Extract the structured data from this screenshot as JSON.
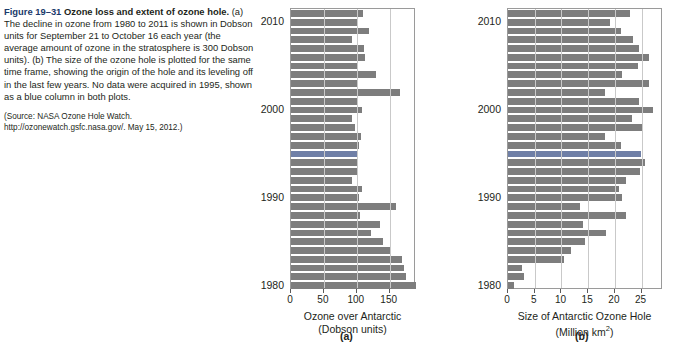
{
  "caption": {
    "figure_number": "Figure 19–31",
    "title": "Ozone loss and extent of ozone hole.",
    "body": "(a) The decline in ozone from 1980 to 2011 is shown in Dobson units for September 21 to October 16 each year (the average amount of ozone in the stratosphere is 300 Dobson units). (b) The size of the ozone hole is plotted for the same time frame, showing the origin of the hole and its leveling off in the last few years. No data were acquired in 1995, shown as a blue column in both plots.",
    "source": "(Source: NASA Ozone Hole Watch. http://ozonewatch.gsfc.nasa.gov/. May 15, 2012.)"
  },
  "panels": {
    "a_label": "(a)",
    "b_label": "(b)"
  },
  "colors": {
    "bar": "#7d7d7d",
    "missing_bar": "#6f7fa6",
    "grid": "#c9c9c9",
    "frame": "#9a9a9a",
    "fignum": "#1b3a6b"
  },
  "chart_data": [
    {
      "id": "a",
      "type": "bar",
      "orientation": "horizontal",
      "title": "",
      "xlabel": "Ozone over Antarctic",
      "xlabel_units": "(Dobson units)",
      "ylabel": "",
      "xlim": [
        0,
        190
      ],
      "xticks": [
        0,
        50,
        100,
        150
      ],
      "xticklabels": [
        "0",
        "50",
        "100",
        "150"
      ],
      "grid": true,
      "year_ticks": [
        1980,
        1990,
        2000,
        2010
      ],
      "missing_year": 1995,
      "missing_note": "No data acquired in 1995, shown as a blue column",
      "categories": [
        1980,
        1981,
        1982,
        1983,
        1984,
        1985,
        1986,
        1987,
        1988,
        1989,
        1990,
        1991,
        1992,
        1993,
        1994,
        1995,
        1996,
        1997,
        1998,
        1999,
        2000,
        2001,
        2002,
        2003,
        2004,
        2005,
        2006,
        2007,
        2008,
        2009,
        2010,
        2011
      ],
      "values": [
        190,
        175,
        172,
        168,
        150,
        140,
        122,
        136,
        105,
        160,
        104,
        108,
        92,
        100,
        100,
        100,
        103,
        107,
        97,
        92,
        108,
        100,
        165,
        101,
        129,
        102,
        112,
        111,
        93,
        119,
        101,
        110
      ]
    },
    {
      "id": "b",
      "type": "bar",
      "orientation": "horizontal",
      "title": "",
      "xlabel": "Size of Antarctic Ozone Hole",
      "xlabel_units": "(Million km²)",
      "ylabel": "",
      "xlim": [
        0,
        29
      ],
      "xticks": [
        0,
        5,
        10,
        15,
        20,
        25
      ],
      "xticklabels": [
        "0",
        "5",
        "10",
        "15",
        "20",
        "25"
      ],
      "grid": true,
      "year_ticks": [
        1980,
        1990,
        2000,
        2010
      ],
      "missing_year": 1995,
      "missing_note": "No data acquired in 1995, shown as a blue column",
      "categories": [
        1980,
        1981,
        1982,
        1983,
        1984,
        1985,
        1986,
        1987,
        1988,
        1989,
        1990,
        1991,
        1992,
        1993,
        1994,
        1995,
        1996,
        1997,
        1998,
        1999,
        2000,
        2001,
        2002,
        2003,
        2004,
        2005,
        2006,
        2007,
        2008,
        2009,
        2010,
        2011
      ],
      "values": [
        1.1,
        3.0,
        2.7,
        10.5,
        11.8,
        14.4,
        18.4,
        14.0,
        22.0,
        13.4,
        21.3,
        20.7,
        22.1,
        24.7,
        25.6,
        24.9,
        21.2,
        18.1,
        25.2,
        23.2,
        27.1,
        24.5,
        18.2,
        26.4,
        21.4,
        24.4,
        26.4,
        24.5,
        23.3,
        21.1,
        19.1,
        22.8
      ]
    }
  ]
}
